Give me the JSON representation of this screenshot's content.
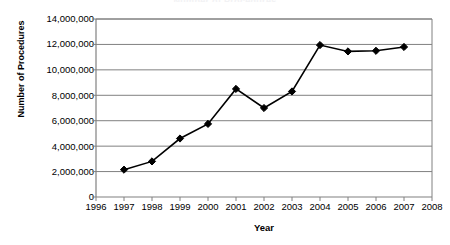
{
  "chart_data": {
    "type": "line",
    "title": "",
    "xlabel": "Year",
    "ylabel": "Number of Procedures",
    "x": [
      1997,
      1998,
      1999,
      2000,
      2001,
      2002,
      2003,
      2004,
      2005,
      2006,
      2007
    ],
    "values": [
      2150000,
      2800000,
      4600000,
      5750000,
      8500000,
      7000000,
      8300000,
      11950000,
      11450000,
      11500000,
      11800000
    ],
    "series": [
      {
        "name": "Number of Procedures",
        "values": [
          2150000,
          2800000,
          4600000,
          5750000,
          8500000,
          7000000,
          8300000,
          11950000,
          11450000,
          11500000,
          11800000
        ]
      }
    ],
    "xlim": [
      1996,
      2008
    ],
    "ylim": [
      0,
      14000000
    ],
    "x_tick_labels": [
      "1996",
      "1997",
      "1998",
      "1999",
      "2000",
      "2001",
      "2002",
      "2003",
      "2004",
      "2005",
      "2006",
      "2007",
      "2008"
    ],
    "y_tick_labels": [
      "0",
      "2,000,000",
      "4,000,000",
      "6,000,000",
      "8,000,000",
      "10,000,000",
      "12,000,000",
      "14,000,000"
    ],
    "y_tick_values": [
      0,
      2000000,
      4000000,
      6000000,
      8000000,
      10000000,
      12000000,
      14000000
    ],
    "grid": "horizontal",
    "legend": "none",
    "marker": "diamond",
    "line_color": "#000000",
    "marker_color": "#000000",
    "grid_color": "#808080",
    "axis_color": "#808080",
    "background_color": "#ffffff"
  },
  "cut_title": "Number of Procedures"
}
